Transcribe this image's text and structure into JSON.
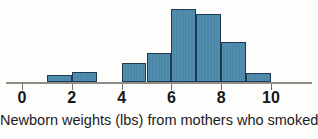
{
  "caption": "Newborn weights (lbs) from mothers who smoked",
  "axis": {
    "tick_labels": [
      "0",
      "2",
      "4",
      "6",
      "8",
      "10"
    ]
  },
  "colors": {
    "bar_fill": "#4c88a9",
    "bar_border": "#1e3a50",
    "axis": "#8d8d87",
    "text": "#17171a",
    "background": "#fdfdfc"
  },
  "chart_data": {
    "type": "bar",
    "title": "",
    "subtitle": "",
    "xlabel": "Newborn weights (lbs) from mothers who smoked",
    "ylabel": "",
    "grid": false,
    "legend": false,
    "xlim": [
      0,
      11
    ],
    "ylim": [
      0,
      10.5
    ],
    "bin_width": 1,
    "bin_edges": [
      0,
      1,
      2,
      3,
      4,
      5,
      6,
      7,
      8,
      9,
      10
    ],
    "categories": [
      "0-1",
      "1-2",
      "2-3",
      "3-4",
      "4-5",
      "5-6",
      "6-7",
      "7-8",
      "8-9",
      "9-10"
    ],
    "values": [
      0,
      1.0,
      1.4,
      0,
      2.6,
      4.0,
      10.0,
      9.3,
      5.5,
      1.2
    ],
    "xticks": [
      0,
      2,
      4,
      6,
      8,
      10
    ],
    "xticklabels": [
      "0",
      "2",
      "4",
      "6",
      "8",
      "10"
    ],
    "yticks": [],
    "yticklabels": []
  }
}
